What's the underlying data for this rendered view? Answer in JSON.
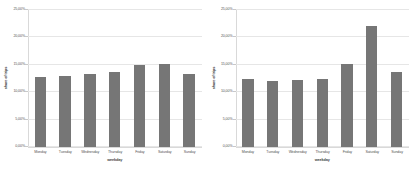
{
  "figure": {
    "background": "#ffffff",
    "bar_color": "#767676",
    "grid_color": "#e6e6e6",
    "axis_color": "#d9d9d9"
  },
  "chart_data": [
    {
      "type": "bar",
      "title": "",
      "xlabel": "weekday",
      "ylabel": "share of trips",
      "categories": [
        "Monday",
        "Tuesday",
        "Wednesday",
        "Thursday",
        "Friday",
        "Saturday",
        "Sunday"
      ],
      "values": [
        12.8,
        13.0,
        13.3,
        13.6,
        14.9,
        15.1,
        13.4
      ],
      "ylim": [
        0,
        25
      ],
      "yticks": [
        0,
        5,
        10,
        15,
        20,
        25
      ],
      "ytick_labels": [
        "0,00%",
        "5,00%",
        "10,00%",
        "15,00%",
        "20,00%",
        "25,00%"
      ],
      "grid": true,
      "legend": "none"
    },
    {
      "type": "bar",
      "title": "",
      "xlabel": "weekday",
      "ylabel": "share of trips",
      "categories": [
        "Monday",
        "Tuesday",
        "Wednesday",
        "Thursday",
        "Friday",
        "Saturday",
        "Sunday"
      ],
      "values": [
        12.4,
        12.0,
        12.2,
        12.5,
        15.2,
        22.0,
        13.7
      ],
      "ylim": [
        0,
        25
      ],
      "yticks": [
        0,
        5,
        10,
        15,
        20,
        25
      ],
      "ytick_labels": [
        "0,00%",
        "5,00%",
        "10,00%",
        "15,00%",
        "20,00%",
        "25,00%"
      ],
      "grid": true,
      "legend": "none"
    }
  ]
}
